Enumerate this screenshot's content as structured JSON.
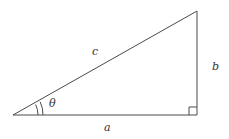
{
  "diagram": {
    "type": "right-triangle",
    "labels": {
      "hypotenuse": "c",
      "opposite": "b",
      "adjacent": "a",
      "angle": "θ"
    },
    "vertices": {
      "left": [
        13,
        115
      ],
      "bottom_right": [
        197,
        115
      ],
      "top_right": [
        197,
        11
      ]
    },
    "right_angle_marker": true,
    "angle_arc_count": 2,
    "colors": {
      "stroke": "#4a4a4a",
      "text": "#333333",
      "background": "#ffffff"
    }
  }
}
